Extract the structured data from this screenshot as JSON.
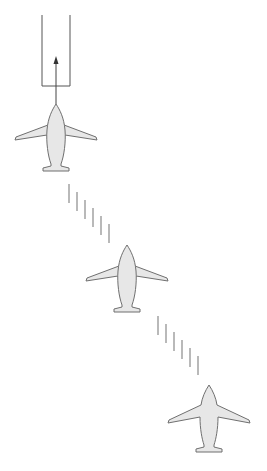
{
  "diagram": {
    "colors": {
      "background": "#ffffff",
      "plane_fill": "#e7e7e7",
      "plane_stroke": "#6f6f6f",
      "dash": "#8a8a8a",
      "gate": "#555555"
    },
    "gate": {
      "x": 42,
      "y_top": 15,
      "width": 28,
      "y_bottom": 86
    },
    "direction_arrow": {
      "x": 56,
      "y_from": 104,
      "y_to": 58
    },
    "planes": [
      {
        "id": "plane-1",
        "cx": 56,
        "nose_y": 104,
        "overlay_fuselage": true
      },
      {
        "id": "plane-2",
        "cx": 127,
        "nose_y": 245,
        "overlay_fuselage": true
      },
      {
        "id": "plane-3",
        "cx": 209,
        "nose_y": 385,
        "overlay_fuselage": false
      }
    ],
    "dash_groups": [
      {
        "id": "dashes-1",
        "xs": [
          69,
          77,
          85,
          93,
          101,
          109
        ],
        "y_start": 184,
        "step_y": 8,
        "length": 19
      },
      {
        "id": "dashes-2",
        "xs": [
          158,
          166,
          174,
          182,
          190,
          198
        ],
        "y_start": 316,
        "step_y": 8,
        "length": 19
      }
    ]
  }
}
